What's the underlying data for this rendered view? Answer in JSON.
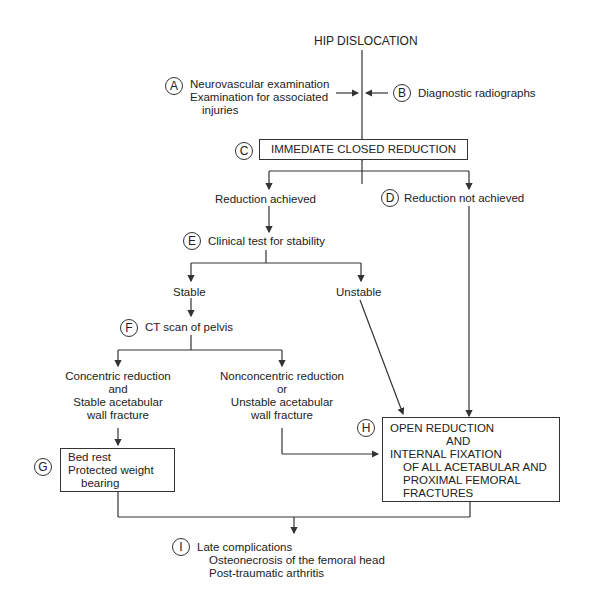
{
  "title": "HIP DISLOCATION",
  "labels": {
    "A": "A",
    "B": "B",
    "C": "C",
    "D": "D",
    "E": "E",
    "F": "F",
    "G": "G",
    "H": "H",
    "I": "I"
  },
  "nodes": {
    "a_line1": "Neurovascular examination",
    "a_line2": "Examination for associated",
    "a_line3": "injuries",
    "b": "Diagnostic radiographs",
    "c": "IMMEDIATE CLOSED REDUCTION",
    "reduction_achieved": "Reduction achieved",
    "d": "Reduction not achieved",
    "e": "Clinical test for stability",
    "stable": "Stable",
    "unstable": "Unstable",
    "f": "CT scan of pelvis",
    "concentric_1": "Concentric reduction",
    "concentric_2": "and",
    "concentric_3": "Stable acetabular",
    "concentric_4": "wall fracture",
    "nonconcentric_1": "Nonconcentric reduction",
    "nonconcentric_2": "or",
    "nonconcentric_3": "Unstable acetabular",
    "nonconcentric_4": "wall fracture",
    "g_1": "Bed rest",
    "g_2": "Protected weight",
    "g_3": "bearing",
    "h_1": "OPEN REDUCTION",
    "h_2": "AND",
    "h_3": "INTERNAL FIXATION",
    "h_4": "OF ALL ACETABULAR AND",
    "h_5": "PROXIMAL FEMORAL",
    "h_6": "FRACTURES",
    "i_1": "Late complications",
    "i_2": "Osteonecrosis of the femoral head",
    "i_3": "Post-traumatic arthritis"
  }
}
